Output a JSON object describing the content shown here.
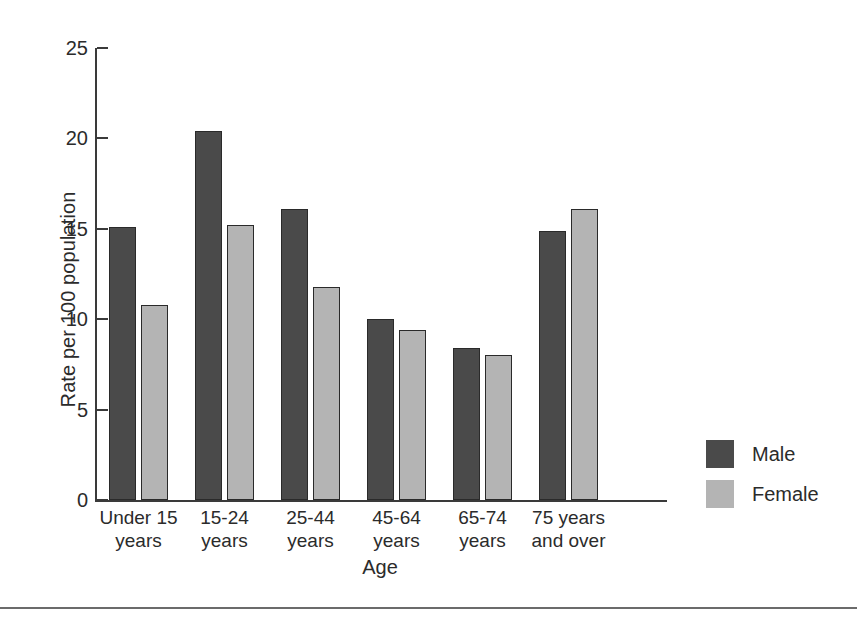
{
  "chart_data": {
    "type": "bar",
    "title": "",
    "xlabel": "Age",
    "ylabel": "Rate per 100 population",
    "categories": [
      "Under 15\nyears",
      "15-24\nyears",
      "25-44\nyears",
      "45-64\nyears",
      "65-74\nyears",
      "75 years\nand over"
    ],
    "category_lines": [
      [
        "Under 15",
        "years"
      ],
      [
        "15-24",
        "years"
      ],
      [
        "25-44",
        "years"
      ],
      [
        "45-64",
        "years"
      ],
      [
        "65-74",
        "years"
      ],
      [
        "75 years",
        "and over"
      ]
    ],
    "series": [
      {
        "name": "Male",
        "color": "#4a4a4a",
        "values": [
          15.1,
          20.4,
          16.1,
          10.0,
          8.4,
          14.9
        ]
      },
      {
        "name": "Female",
        "color": "#b4b4b4",
        "values": [
          10.8,
          15.2,
          11.8,
          9.4,
          8.0,
          16.1
        ]
      }
    ],
    "ylim": [
      0,
      25
    ],
    "yticks": [
      0,
      5,
      10,
      15,
      20,
      25
    ],
    "ytick_labels": [
      "0",
      "5",
      "10",
      "15",
      "20",
      "25"
    ],
    "grid": false,
    "legend_position": "right"
  },
  "legend": {
    "entries": [
      {
        "label": "Male",
        "color": "#4a4a4a"
      },
      {
        "label": "Female",
        "color": "#b4b4b4"
      }
    ]
  }
}
